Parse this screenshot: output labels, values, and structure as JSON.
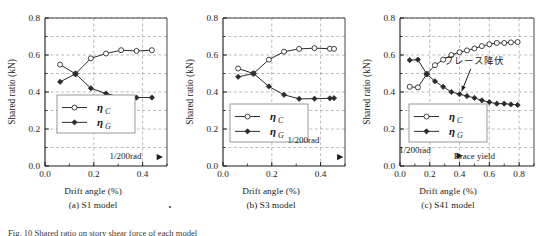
{
  "figure": {
    "caption_partial": "Fig. 10   Shared ratio on story shear force of each model",
    "y_axis_label": "Shared ratio (kN)",
    "x_axis_label": "Drift angle (%)",
    "legend": {
      "series_c_label": "η",
      "series_c_sub": "C",
      "series_g_label": "η",
      "series_g_sub": "G"
    },
    "marker_label": "1/200rad",
    "colors": {
      "line": "#2b2b2b",
      "grid": "#8f8f8f",
      "axis": "#1a1a1a",
      "text": "#1a1a1a",
      "marker_fill_open": "#ffffff"
    }
  },
  "panels": [
    {
      "id": "a",
      "caption": "(a) S1 model",
      "x_axis_label": "Drift angle (%)",
      "y_axis_label": "Shared ratio (kN)",
      "annotations": [
        {
          "name": "drift-marker",
          "text": "1/200rad",
          "x": 0.33,
          "y": 0.055
        }
      ]
    },
    {
      "id": "b",
      "caption": "(b) S3 model",
      "x_axis_label": "Drift angle (%)",
      "y_axis_label": "Shared ratio (kN)",
      "annotations": [
        {
          "name": "drift-marker",
          "text": "1/200rad",
          "x": 0.33,
          "y": 0.14
        }
      ]
    },
    {
      "id": "c",
      "caption": "(c) S41 model",
      "x_axis_label": "Drift angle (%)",
      "y_axis_label": "Shared ratio (kN)",
      "annotations": [
        {
          "name": "brace-yield-jp",
          "text": "ブレース降伏",
          "x": 0.5,
          "y": 0.565
        },
        {
          "name": "drift-marker",
          "text": "1/200rad",
          "x": 0.1,
          "y": 0.085
        },
        {
          "name": "brace-yield-en",
          "text": "Brace yield",
          "x": 0.5,
          "y": 0.055
        }
      ]
    }
  ],
  "chart_data": [
    {
      "type": "line",
      "panel": "(a) S1 model",
      "title": "",
      "xlabel": "Drift angle (%)",
      "ylabel": "Shared ratio (kN)",
      "xlim": [
        0.0,
        0.5
      ],
      "ylim": [
        0.0,
        0.8
      ],
      "xticks": [
        0.0,
        0.2,
        0.4
      ],
      "xtick_labels": [
        "0.0",
        "0.2",
        "0.4"
      ],
      "yticks": [
        0.0,
        0.2,
        0.4,
        0.6,
        0.8
      ],
      "ytick_labels": [
        "0.0",
        "0.2",
        "0.4",
        "0.6",
        "0.8"
      ],
      "grid": true,
      "legend": [
        "η C",
        "η G"
      ],
      "legend_position": "lower-left",
      "series": [
        {
          "name": "η C",
          "marker": "open-circle",
          "x": [
            0.062,
            0.125,
            0.188,
            0.25,
            0.312,
            0.375,
            0.438
          ],
          "values": [
            0.548,
            0.498,
            0.582,
            0.608,
            0.626,
            0.622,
            0.626
          ]
        },
        {
          "name": "η G",
          "marker": "filled-diamond",
          "x": [
            0.062,
            0.125,
            0.188,
            0.25,
            0.312,
            0.375,
            0.438
          ],
          "values": [
            0.455,
            0.498,
            0.42,
            0.392,
            0.37,
            0.37,
            0.37
          ]
        }
      ],
      "annotations": [
        {
          "text": "1/200rad",
          "x": 0.33,
          "y": 0.055
        },
        {
          "text": "▶",
          "x": 0.47,
          "y": 0.048
        }
      ]
    },
    {
      "type": "line",
      "panel": "(b) S3 model",
      "title": "",
      "xlabel": "Drift angle (%)",
      "ylabel": "Shared ratio (kN)",
      "xlim": [
        0.0,
        0.5
      ],
      "ylim": [
        0.0,
        0.8
      ],
      "xticks": [
        0.0,
        0.2,
        0.4
      ],
      "xtick_labels": [
        "0.0",
        "0.2",
        "0.4"
      ],
      "yticks": [
        0.0,
        0.2,
        0.4,
        0.6,
        0.8
      ],
      "ytick_labels": [
        "0.0",
        "0.2",
        "0.4",
        "0.6",
        "0.8"
      ],
      "grid": true,
      "legend": [
        "η C",
        "η G"
      ],
      "legend_position": "lower-left",
      "series": [
        {
          "name": "η C",
          "marker": "open-circle",
          "x": [
            0.062,
            0.125,
            0.188,
            0.25,
            0.312,
            0.375,
            0.438,
            0.455
          ],
          "values": [
            0.527,
            0.5,
            0.575,
            0.618,
            0.633,
            0.637,
            0.634,
            0.633
          ]
        },
        {
          "name": "η G",
          "marker": "filled-diamond",
          "x": [
            0.062,
            0.125,
            0.188,
            0.25,
            0.312,
            0.375,
            0.438,
            0.455
          ],
          "values": [
            0.482,
            0.5,
            0.43,
            0.385,
            0.363,
            0.364,
            0.366,
            0.367
          ]
        }
      ],
      "annotations": [
        {
          "text": "1/200rad",
          "x": 0.33,
          "y": 0.14
        },
        {
          "text": "▶",
          "x": 0.48,
          "y": 0.048
        }
      ]
    },
    {
      "type": "line",
      "panel": "(c) S41 model",
      "title": "",
      "xlabel": "Drift angle (%)",
      "ylabel": "Shared ratio (kN)",
      "xlim": [
        0.0,
        0.9
      ],
      "ylim": [
        0.0,
        0.8
      ],
      "xticks": [
        0.0,
        0.2,
        0.4,
        0.6,
        0.8
      ],
      "xtick_labels": [
        "0.0",
        "0.2",
        "0.4",
        "0.6",
        "0.8"
      ],
      "yticks": [
        0.0,
        0.2,
        0.4,
        0.6,
        0.8
      ],
      "ytick_labels": [
        "0.0",
        "0.2",
        "0.4",
        "0.6",
        "0.8"
      ],
      "grid": true,
      "legend": [
        "η C",
        "η G"
      ],
      "legend_position": "lower-left",
      "series": [
        {
          "name": "η C",
          "marker": "open-circle",
          "x": [
            0.065,
            0.12,
            0.18,
            0.235,
            0.29,
            0.345,
            0.4,
            0.45,
            0.5,
            0.55,
            0.6,
            0.65,
            0.7,
            0.745,
            0.79
          ],
          "values": [
            0.428,
            0.425,
            0.497,
            0.545,
            0.575,
            0.6,
            0.615,
            0.625,
            0.635,
            0.648,
            0.658,
            0.665,
            0.665,
            0.668,
            0.67
          ]
        },
        {
          "name": "η G",
          "marker": "filled-diamond",
          "x": [
            0.065,
            0.12,
            0.18,
            0.235,
            0.29,
            0.345,
            0.4,
            0.45,
            0.5,
            0.55,
            0.6,
            0.65,
            0.7,
            0.745,
            0.79
          ],
          "values": [
            0.572,
            0.575,
            0.497,
            0.458,
            0.428,
            0.4,
            0.388,
            0.378,
            0.368,
            0.355,
            0.345,
            0.337,
            0.337,
            0.333,
            0.33
          ]
        }
      ],
      "annotations": [
        {
          "text": "ブレース降伏",
          "x": 0.5,
          "y": 0.565
        },
        {
          "text": "1/200rad",
          "x": 0.1,
          "y": 0.085
        },
        {
          "text": "Brace yield",
          "x": 0.5,
          "y": 0.055
        },
        {
          "text": "▶",
          "x": 0.4,
          "y": 0.055
        }
      ]
    }
  ]
}
